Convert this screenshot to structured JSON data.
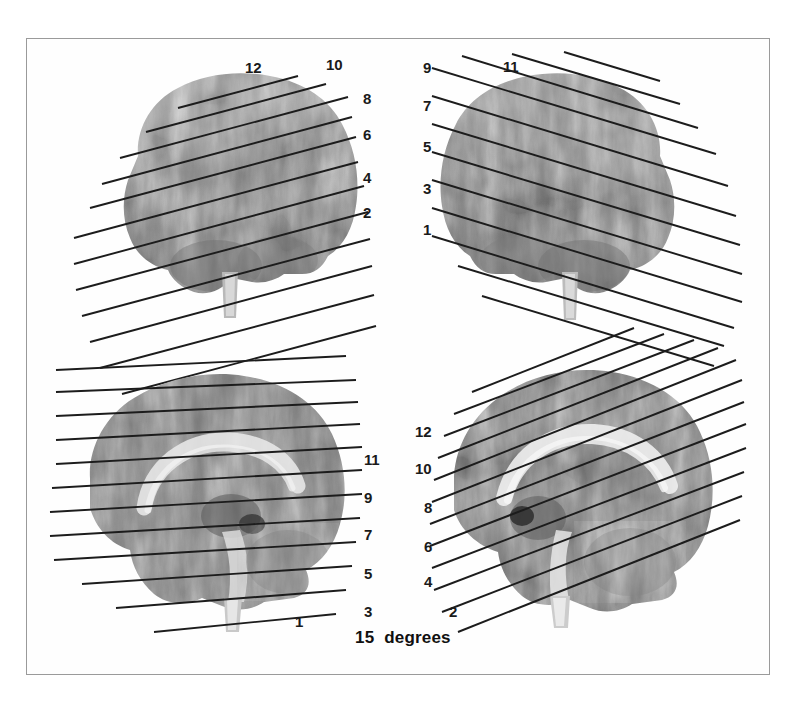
{
  "figure": {
    "caption": "15  degrees",
    "angle_degrees": 15,
    "panel_count": 4,
    "slice_count": 12,
    "line_color": "#1c1c1c",
    "frame_color": "#9a9a9a",
    "background": "#ffffff"
  },
  "panels": [
    {
      "id": "top-left",
      "view": "sagittal-lateral",
      "orientation": "anterior-right",
      "labels": [
        {
          "text": "12",
          "x": 245,
          "y": 60
        },
        {
          "text": "10",
          "x": 326,
          "y": 57
        },
        {
          "text": "8",
          "x": 363,
          "y": 91
        },
        {
          "text": "6",
          "x": 363,
          "y": 127
        },
        {
          "text": "4",
          "x": 363,
          "y": 170
        },
        {
          "text": "2",
          "x": 363,
          "y": 205
        }
      ]
    },
    {
      "id": "top-right",
      "view": "sagittal-lateral",
      "orientation": "anterior-left",
      "labels": [
        {
          "text": "9",
          "x": 428,
          "y": 60
        },
        {
          "text": "11",
          "x": 508,
          "y": 59
        },
        {
          "text": "7",
          "x": 428,
          "y": 98
        },
        {
          "text": "5",
          "x": 428,
          "y": 139
        },
        {
          "text": "3",
          "x": 428,
          "y": 181
        },
        {
          "text": "1",
          "x": 428,
          "y": 222
        }
      ]
    },
    {
      "id": "bottom-left",
      "view": "sagittal-midline",
      "orientation": "anterior-right",
      "labels": [
        {
          "text": "11",
          "x": 364,
          "y": 452
        },
        {
          "text": "9",
          "x": 364,
          "y": 490
        },
        {
          "text": "7",
          "x": 364,
          "y": 527
        },
        {
          "text": "5",
          "x": 364,
          "y": 566
        },
        {
          "text": "3",
          "x": 364,
          "y": 604
        },
        {
          "text": "1",
          "x": 295,
          "y": 614
        }
      ]
    },
    {
      "id": "bottom-right",
      "view": "sagittal-midline",
      "orientation": "anterior-left",
      "labels": [
        {
          "text": "12",
          "x": 424,
          "y": 424
        },
        {
          "text": "10",
          "x": 424,
          "y": 461
        },
        {
          "text": "8",
          "x": 431,
          "y": 500
        },
        {
          "text": "6",
          "x": 431,
          "y": 539
        },
        {
          "text": "4",
          "x": 431,
          "y": 574
        },
        {
          "text": "2",
          "x": 456,
          "y": 604
        }
      ]
    }
  ],
  "slice_numbers": [
    1,
    2,
    3,
    4,
    5,
    6,
    7,
    8,
    9,
    10,
    11,
    12
  ]
}
